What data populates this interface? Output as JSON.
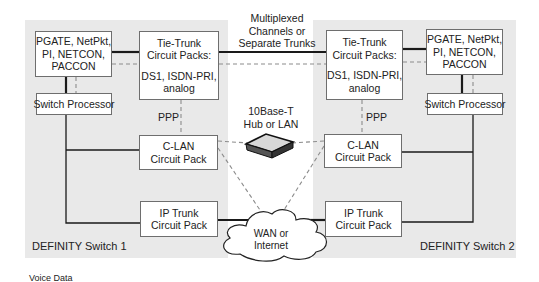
{
  "switch1": {
    "label": "DEFINITY Switch 1",
    "pgate": {
      "lines": [
        "PGATE, NetPkt,",
        "PI, NETCON,",
        "PACCON"
      ]
    },
    "tie_trunk": {
      "lines": [
        "Tie-Trunk",
        "Circuit Packs:",
        "DS1, ISDN-PRI,",
        "analog"
      ]
    },
    "switch_processor": "Switch Processor",
    "ppp": "PPP",
    "clan": {
      "lines": [
        "C-LAN",
        "Circuit Pack"
      ]
    },
    "ip_trunk": {
      "lines": [
        "IP Trunk",
        "Circuit Pack"
      ]
    }
  },
  "switch2": {
    "label": "DEFINITY Switch 2",
    "pgate": {
      "lines": [
        "PGATE, NetPkt,",
        "PI, NETCON,",
        "PACCON"
      ]
    },
    "tie_trunk": {
      "lines": [
        "Tie-Trunk",
        "Circuit Packs:",
        "DS1, ISDN-PRI,",
        "analog"
      ]
    },
    "switch_processor": "Switch Processor",
    "ppp": "PPP",
    "clan": {
      "lines": [
        "C-LAN",
        "Circuit Pack"
      ]
    },
    "ip_trunk": {
      "lines": [
        "IP Trunk",
        "Circuit Pack"
      ]
    }
  },
  "trunk_link": {
    "lines": [
      "Multiplexed",
      "Channels or",
      "Separate Trunks"
    ]
  },
  "hub": {
    "lines": [
      "10Base-T",
      "Hub or LAN"
    ]
  },
  "wan": {
    "lines": [
      "WAN or",
      "Internet"
    ]
  },
  "legend": "Voice Data",
  "colors": {
    "panel": "#e9e9e9",
    "box_border": "#6e6e6e",
    "voice_line": "#1a1a1a",
    "data_line": "#8c8c8c"
  }
}
